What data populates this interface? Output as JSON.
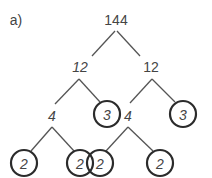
{
  "part_label": "a)",
  "tree": {
    "root": "144",
    "level1_left": "12",
    "level1_right": "12",
    "level2_left_composite": "4",
    "level2_left_prime": "3",
    "level2_right_composite": "4",
    "level2_right_prime": "3",
    "leaves": [
      "2",
      "2",
      "2",
      "2"
    ]
  },
  "colors": {
    "line": "#444444",
    "circle": "#2b2b2b",
    "text": "#444444"
  }
}
